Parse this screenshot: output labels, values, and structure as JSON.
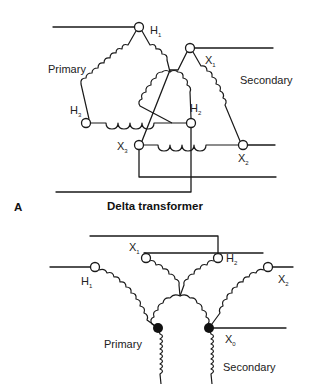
{
  "figure": {
    "panel_a": {
      "letter": "A",
      "title": "Delta transformer",
      "primary_label": "Primary",
      "secondary_label": "Secondary",
      "terminals": {
        "h1": {
          "base": "H",
          "sub": "1"
        },
        "h2": {
          "base": "H",
          "sub": "2"
        },
        "h3": {
          "base": "H",
          "sub": "3"
        },
        "x1": {
          "base": "X",
          "sub": "1"
        },
        "x2": {
          "base": "X",
          "sub": "2"
        },
        "x3": {
          "base": "X",
          "sub": "3"
        }
      }
    },
    "panel_b": {
      "primary_label": "Primary",
      "secondary_label": "Secondary",
      "terminals": {
        "h1": {
          "base": "H",
          "sub": "1"
        },
        "h2": {
          "base": "H",
          "sub": "2"
        },
        "x1": {
          "base": "X",
          "sub": "1"
        },
        "x2": {
          "base": "X",
          "sub": "2"
        },
        "x0": {
          "base": "X",
          "sub": "0"
        }
      }
    }
  }
}
